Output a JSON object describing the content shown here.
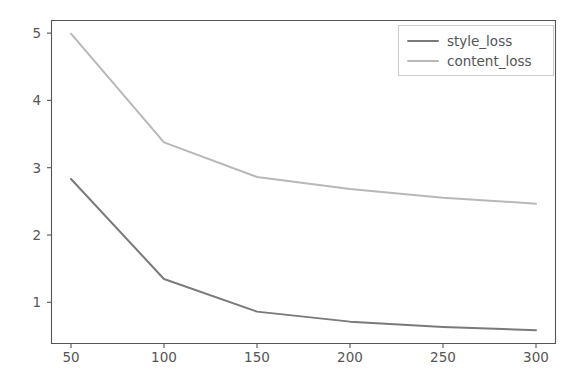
{
  "chart_data": {
    "type": "line",
    "title": "",
    "xlabel": "",
    "ylabel": "",
    "x": [
      50,
      100,
      150,
      200,
      250,
      300
    ],
    "series": [
      {
        "name": "style_loss",
        "values": [
          2.72,
          1.22,
          0.73,
          0.58,
          0.5,
          0.45
        ],
        "color": "#7a7a7a"
      },
      {
        "name": "content_loss",
        "values": [
          4.9,
          3.27,
          2.75,
          2.57,
          2.44,
          2.35
        ],
        "color": "#b8b8b8"
      }
    ],
    "xticks": [
      "50",
      "100",
      "150",
      "200",
      "250",
      "300"
    ],
    "xtick_values": [
      50,
      100,
      150,
      200,
      250,
      300
    ],
    "yticks": [
      "1",
      "2",
      "3",
      "4",
      "5"
    ],
    "ytick_values": [
      1,
      2,
      3,
      4,
      5
    ],
    "xlim": [
      39.25,
      310.75
    ],
    "ylim": [
      0.2444,
      5.1056
    ],
    "grid": false,
    "legend_position": "upper right",
    "background_color": "#ffffff",
    "axis_color": "#555555"
  },
  "legend": {
    "entries": [
      {
        "label": "style_loss",
        "color": "#7a7a7a"
      },
      {
        "label": "content_loss",
        "color": "#b8b8b8"
      }
    ]
  }
}
